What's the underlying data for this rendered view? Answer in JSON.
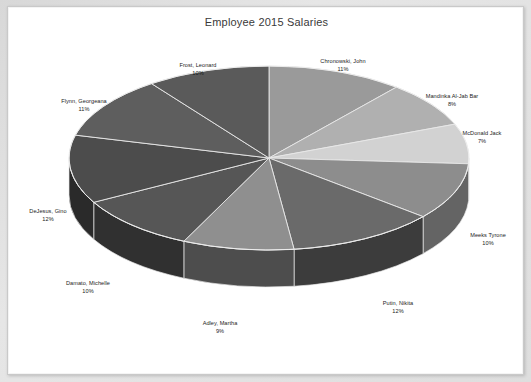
{
  "chart_data": {
    "type": "pie",
    "title": "Employee 2015 Salaries",
    "xlabel": "",
    "ylabel": "",
    "legend_position": "none",
    "labels_outside": true,
    "three_d": true,
    "start_angle_deg": 0,
    "direction": "clockwise",
    "categories": [
      "Chronowski, John",
      "Mandinka Al-Jab Bar",
      "McDonald Jack",
      "Meeks Tyrone",
      "Putin, Nikita",
      "Adley, Martha",
      "Damato, Michelle",
      "DeJesus, Gino",
      "Flynn, Georgeana",
      "Frost, Leonard"
    ],
    "values": [
      11,
      8,
      7,
      10,
      12,
      9,
      10,
      12,
      11,
      10
    ],
    "value_unit": "%",
    "slice_colors": [
      "#9a9a9a",
      "#b0b0b0",
      "#d2d2d2",
      "#8d8d8d",
      "#6a6a6a",
      "#8f8f8f",
      "#565656",
      "#4c4c4c",
      "#5e5e5e",
      "#5a5a5a"
    ],
    "side_colors": [
      "#6d6d6d",
      "#7d7d7d",
      "#969696",
      "#646464",
      "#3c3c3c",
      "#4d4d4d",
      "#303030",
      "#2a2a2a",
      "#353535",
      "#333333"
    ],
    "slices": [
      {
        "label": "Chronowski, John",
        "pct": "11%",
        "value": 11
      },
      {
        "label": "Mandinka Al-Jab Bar",
        "pct": "8%",
        "value": 8
      },
      {
        "label": "McDonald Jack",
        "pct": "7%",
        "value": 7
      },
      {
        "label": "Meeks Tyrone",
        "pct": "10%",
        "value": 10
      },
      {
        "label": "Putin, Nikita",
        "pct": "12%",
        "value": 12
      },
      {
        "label": "Adley, Martha",
        "pct": "9%",
        "value": 9
      },
      {
        "label": "Damato, Michelle",
        "pct": "10%",
        "value": 10
      },
      {
        "label": "DeJesus, Gino",
        "pct": "12%",
        "value": 12
      },
      {
        "label": "Flynn, Georgeana",
        "pct": "11%",
        "value": 11
      },
      {
        "label": "Frost, Leonard",
        "pct": "10%",
        "value": 10
      }
    ]
  },
  "colors": {
    "card_background": "#ffffff",
    "page_background": "#e2e2e2",
    "title_text": "#3a3a3a",
    "label_text": "#1c1c1c",
    "slice_divider": "#e8e8e8"
  }
}
